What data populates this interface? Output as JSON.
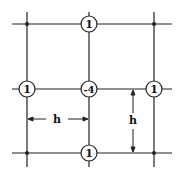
{
  "diagram": {
    "nodes": {
      "top": "1",
      "left": "1",
      "center": "-4",
      "right": "1",
      "bottom": "1"
    },
    "dimensions": {
      "horizontal_spacing": "h",
      "vertical_spacing": "h"
    },
    "colors": {
      "line": "#222222",
      "background": "#ffffff"
    }
  }
}
